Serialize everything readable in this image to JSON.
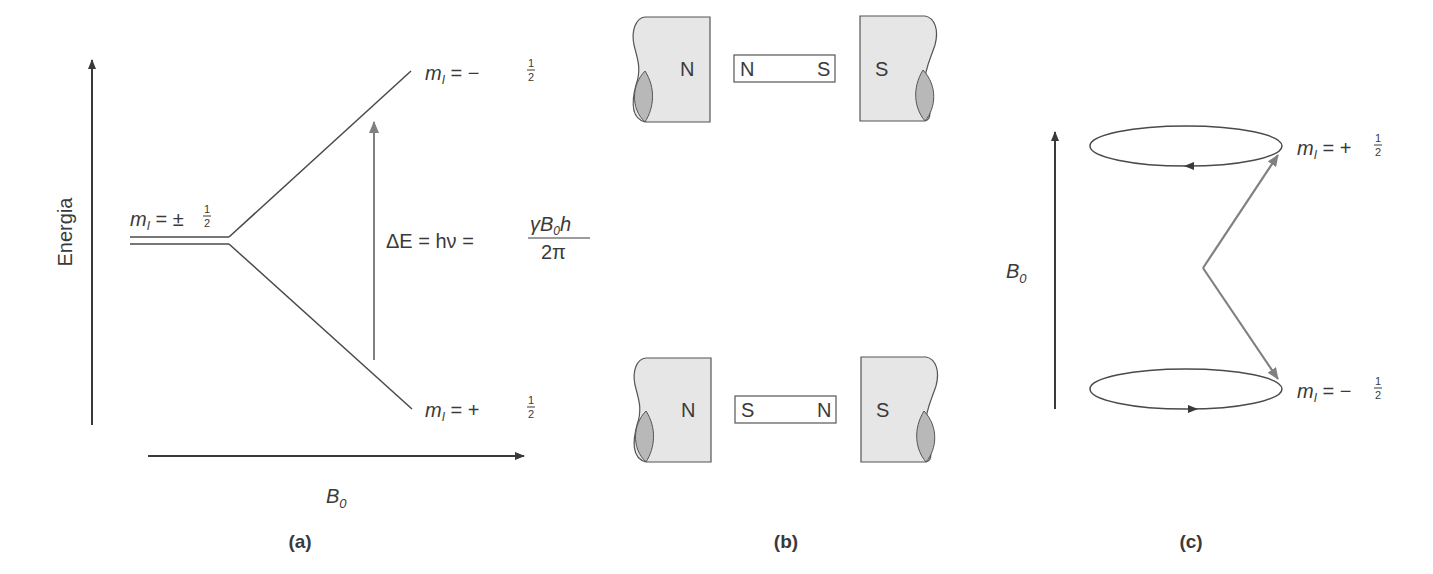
{
  "panels": {
    "a": {
      "caption": "(a)",
      "y_axis_label": "Energia",
      "x_axis_label_main": "B",
      "x_axis_label_sub": "0",
      "degenerate_level": {
        "m": "m",
        "sub": "I",
        "eq": " = ±",
        "frac_num": "1",
        "frac_den": "2"
      },
      "upper_level": {
        "m": "m",
        "sub": "I",
        "eq": " = −",
        "frac_num": "1",
        "frac_den": "2"
      },
      "lower_level": {
        "m": "m",
        "sub": "I",
        "eq": " = +",
        "frac_num": "1",
        "frac_den": "2"
      },
      "transition": {
        "lhs": "ΔE = hν = ",
        "num_pre": "γB",
        "num_sub": "0",
        "num_post": "h",
        "den": "2π"
      }
    },
    "b": {
      "caption": "(b)",
      "top": {
        "left_pole": "N",
        "bar_left": "N",
        "bar_right": "S",
        "right_pole": "S"
      },
      "bottom": {
        "left_pole": "N",
        "bar_left": "S",
        "bar_right": "N",
        "right_pole": "S"
      }
    },
    "c": {
      "caption": "(c)",
      "field_label_main": "B",
      "field_label_sub": "0",
      "upper_state": {
        "m": "m",
        "sub": "I",
        "eq": " = +",
        "frac_num": "1",
        "frac_den": "2"
      },
      "lower_state": {
        "m": "m",
        "sub": "I",
        "eq": " = −",
        "frac_num": "1",
        "frac_den": "2"
      }
    }
  },
  "colors": {
    "line": "#4a4a4a",
    "arrow_gray": "#808080",
    "magnet_fill": "#e6e6e6",
    "magnet_shadow": "#b8b8b8"
  }
}
